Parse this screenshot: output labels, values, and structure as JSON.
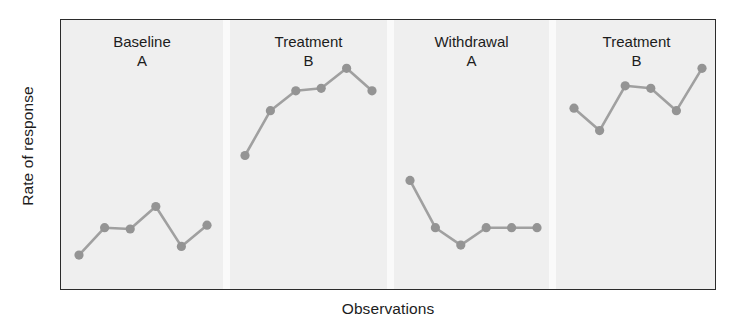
{
  "chart_data": {
    "type": "line",
    "title": "",
    "subtitle": "",
    "xlabel": "Observations",
    "ylabel": "Rate of response",
    "grid": false,
    "legend": "none",
    "axis_ticks": "none",
    "xlim": [
      0,
      24
    ],
    "ylim": [
      0,
      10
    ],
    "colors": {
      "marker": "#949494",
      "line": "#a0a0a0",
      "panel_background": "#efefef",
      "frame": "#2b2b2b",
      "divider": "#fbfbfb",
      "text": "#1c1c1c",
      "page_background": "#ffffff"
    },
    "panels": [
      {
        "label": "Baseline",
        "condition": "A",
        "x": [
          1,
          2,
          3,
          4,
          5,
          6
        ],
        "values": [
          1.0,
          2.1,
          2.05,
          2.95,
          1.35,
          2.2
        ]
      },
      {
        "label": "Treatment",
        "condition": "B",
        "x": [
          7,
          8,
          9,
          10,
          11,
          12
        ],
        "values": [
          5.0,
          6.8,
          7.6,
          7.7,
          8.5,
          7.6
        ]
      },
      {
        "label": "Withdrawal",
        "condition": "A",
        "x": [
          13,
          14,
          15,
          16,
          17,
          18
        ],
        "values": [
          4.0,
          2.1,
          1.4,
          2.1,
          2.1,
          2.1
        ]
      },
      {
        "label": "Treatment",
        "condition": "B",
        "x": [
          19,
          20,
          21,
          22,
          23,
          24
        ],
        "values": [
          6.9,
          6.0,
          7.8,
          7.7,
          6.8,
          8.5
        ]
      }
    ]
  },
  "axes": {
    "y_label": "Rate of response",
    "x_label": "Observations"
  },
  "panel_labels": [
    {
      "name": "Baseline",
      "condition": "A"
    },
    {
      "name": "Treatment",
      "condition": "B"
    },
    {
      "name": "Withdrawal",
      "condition": "A"
    },
    {
      "name": "Treatment",
      "condition": "B"
    }
  ]
}
